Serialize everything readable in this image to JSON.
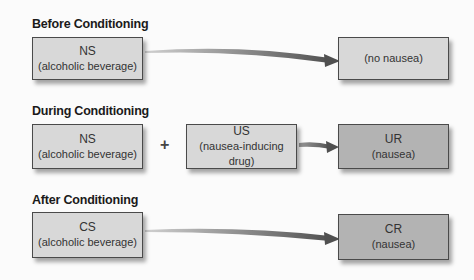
{
  "sections": [
    {
      "title": "Before Conditioning",
      "left": {
        "abbr": "NS",
        "label": "(alcoholic beverage)"
      },
      "right": {
        "abbr": "",
        "label": "(no nausea)"
      }
    },
    {
      "title": "During Conditioning",
      "left": {
        "abbr": "NS",
        "label": "(alcoholic beverage)"
      },
      "operator": "+",
      "middle": {
        "abbr": "US",
        "label": "(nausea-inducing drug)"
      },
      "right": {
        "abbr": "UR",
        "label": "(nausea)"
      }
    },
    {
      "title": "After Conditioning",
      "left": {
        "abbr": "CS",
        "label": "(alcoholic beverage)"
      },
      "right": {
        "abbr": "CR",
        "label": "(nausea)"
      }
    }
  ],
  "colors": {
    "light_box": "#d8d8d8",
    "dark_box": "#b3b3b3",
    "arrow": "#555555"
  }
}
